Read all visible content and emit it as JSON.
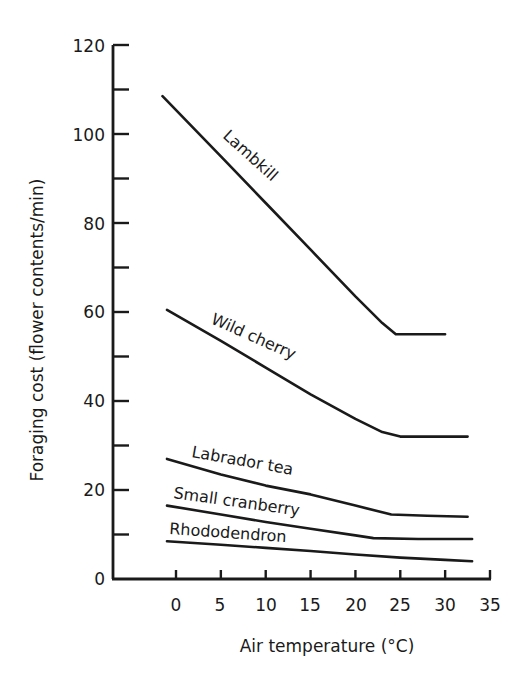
{
  "chart_data": {
    "type": "line",
    "title": "",
    "xlabel": "Air temperature (°C)",
    "ylabel": "Foraging cost (flower contents/min)",
    "xlim": [
      -7,
      35
    ],
    "ylim": [
      0,
      120
    ],
    "x_ticks": [
      0,
      5,
      10,
      15,
      20,
      25,
      30,
      35
    ],
    "y_ticks": [
      0,
      20,
      40,
      60,
      80,
      100,
      120
    ],
    "y_minor_ticks": [
      10,
      30,
      50,
      70,
      90,
      110
    ],
    "grid": false,
    "legend": "inline labels on curves",
    "series": [
      {
        "name": "Lambkill",
        "x": [
          -1.5,
          5,
          10,
          15,
          20,
          23,
          24.5,
          27,
          30
        ],
        "y": [
          108.5,
          95,
          84.5,
          74,
          63.5,
          57.5,
          55,
          55,
          55
        ]
      },
      {
        "name": "Wild cherry",
        "x": [
          -1,
          5,
          10,
          15,
          20,
          23,
          25,
          30,
          32.5
        ],
        "y": [
          60.5,
          53.5,
          47.5,
          41.5,
          36,
          33,
          32,
          32,
          32
        ]
      },
      {
        "name": "Labrador tea",
        "x": [
          -1,
          5,
          10,
          15,
          20,
          24,
          28,
          32.5
        ],
        "y": [
          27,
          23.5,
          21,
          19,
          16.5,
          14.5,
          14.2,
          14
        ]
      },
      {
        "name": "Small cranberry",
        "x": [
          -1,
          5,
          10,
          15,
          20,
          22,
          27,
          33
        ],
        "y": [
          16.5,
          14.5,
          12.8,
          11.3,
          9.8,
          9.2,
          9,
          9
        ]
      },
      {
        "name": "Rhododendron",
        "x": [
          -1,
          5,
          10,
          15,
          20,
          25,
          30,
          33
        ],
        "y": [
          8.5,
          7.7,
          7,
          6.3,
          5.5,
          4.8,
          4.3,
          4
        ]
      }
    ]
  },
  "labels": {
    "xlabel": "Air temperature (°C)",
    "ylabel": "Foraging cost (flower contents/min)",
    "x_ticks": [
      "0",
      "5",
      "10",
      "15",
      "20",
      "25",
      "30",
      "35"
    ],
    "y_ticks": [
      "0",
      "20",
      "40",
      "60",
      "80",
      "100",
      "120"
    ],
    "series": [
      "Lambkill",
      "Wild cherry",
      "Labrador tea",
      "Small cranberry",
      "Rhododendron"
    ]
  }
}
